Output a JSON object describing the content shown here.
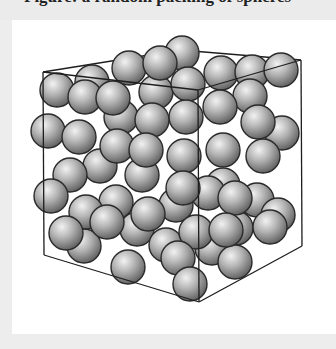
{
  "caption": {
    "text": "Figure: a random packing of spheres"
  },
  "figure": {
    "colors": {
      "page_background": "#ededed",
      "panel_background": "#ffffff",
      "sphere_highlight": "#f2f2f2",
      "sphere_mid": "#b4b4b4",
      "sphere_shadow": "#5c5c5c",
      "sphere_outline": "#2a2a2a",
      "box_edge": "#1e1e1e"
    },
    "sphere_radius": 17,
    "box_back_edges": [
      {
        "x1": 43,
        "y1": 72,
        "x2": 180,
        "y2": 50
      },
      {
        "x1": 180,
        "y1": 50,
        "x2": 301,
        "y2": 60
      }
    ],
    "spheres_back": [
      {
        "x": 182,
        "y": 53
      },
      {
        "x": 92,
        "y": 82
      },
      {
        "x": 129,
        "y": 68
      },
      {
        "x": 221,
        "y": 73
      },
      {
        "x": 252,
        "y": 72
      },
      {
        "x": 281,
        "y": 70
      },
      {
        "x": 156,
        "y": 92
      },
      {
        "x": 121,
        "y": 117
      },
      {
        "x": 100,
        "y": 166
      },
      {
        "x": 142,
        "y": 175
      },
      {
        "x": 223,
        "y": 185
      },
      {
        "x": 257,
        "y": 200
      },
      {
        "x": 116,
        "y": 202
      },
      {
        "x": 176,
        "y": 205
      },
      {
        "x": 137,
        "y": 229
      },
      {
        "x": 166,
        "y": 245
      },
      {
        "x": 212,
        "y": 248
      },
      {
        "x": 236,
        "y": 228
      },
      {
        "x": 278,
        "y": 215
      },
      {
        "x": 84,
        "y": 246
      }
    ],
    "spheres_front": [
      {
        "x": 188,
        "y": 84
      },
      {
        "x": 250,
        "y": 96
      },
      {
        "x": 220,
        "y": 107
      },
      {
        "x": 57,
        "y": 90
      },
      {
        "x": 85,
        "y": 97
      },
      {
        "x": 113,
        "y": 98
      },
      {
        "x": 160,
        "y": 63
      },
      {
        "x": 282,
        "y": 133
      },
      {
        "x": 258,
        "y": 122
      },
      {
        "x": 263,
        "y": 156
      },
      {
        "x": 186,
        "y": 117
      },
      {
        "x": 152,
        "y": 120
      },
      {
        "x": 48,
        "y": 131
      },
      {
        "x": 79,
        "y": 137
      },
      {
        "x": 117,
        "y": 146
      },
      {
        "x": 70,
        "y": 175
      },
      {
        "x": 146,
        "y": 150
      },
      {
        "x": 184,
        "y": 156
      },
      {
        "x": 223,
        "y": 150
      },
      {
        "x": 208,
        "y": 193
      },
      {
        "x": 51,
        "y": 196
      },
      {
        "x": 86,
        "y": 212
      },
      {
        "x": 183,
        "y": 188
      },
      {
        "x": 235,
        "y": 198
      },
      {
        "x": 66,
        "y": 233
      },
      {
        "x": 107,
        "y": 222
      },
      {
        "x": 148,
        "y": 214
      },
      {
        "x": 196,
        "y": 232
      },
      {
        "x": 270,
        "y": 227
      },
      {
        "x": 235,
        "y": 262
      },
      {
        "x": 178,
        "y": 258
      },
      {
        "x": 128,
        "y": 267
      },
      {
        "x": 226,
        "y": 230
      },
      {
        "x": 190,
        "y": 284
      }
    ],
    "box_front_edges": [
      {
        "x1": 43,
        "y1": 72,
        "x2": 198,
        "y2": 90
      },
      {
        "x1": 198,
        "y1": 90,
        "x2": 301,
        "y2": 60
      },
      {
        "x1": 43,
        "y1": 72,
        "x2": 44,
        "y2": 255
      },
      {
        "x1": 198,
        "y1": 90,
        "x2": 199,
        "y2": 302
      },
      {
        "x1": 301,
        "y1": 60,
        "x2": 302,
        "y2": 246
      },
      {
        "x1": 44,
        "y1": 255,
        "x2": 199,
        "y2": 302
      },
      {
        "x1": 199,
        "y1": 302,
        "x2": 302,
        "y2": 246
      }
    ]
  }
}
